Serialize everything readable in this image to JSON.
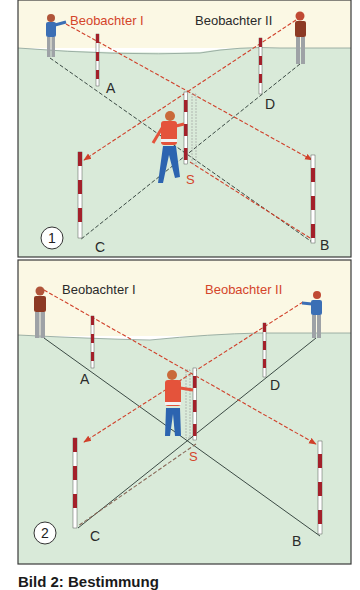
{
  "colors": {
    "sky": "#fbf8e4",
    "ground": "#d9ead9",
    "frame": "#3a3a3a",
    "red_line": "#d0402a",
    "dark_line": "#3b4a44",
    "label_red": "#d4452a",
    "label_dark": "#2a2a2a"
  },
  "panels": [
    {
      "id": 1,
      "number": "1",
      "observer_1_label": "Beobachter I",
      "observer_2_label": "Beobachter II",
      "active_observer": 1,
      "point_labels": {
        "A": "A",
        "B": "B",
        "C": "C",
        "D": "D",
        "S": "S"
      }
    },
    {
      "id": 2,
      "number": "2",
      "observer_1_label": "Beobachter I",
      "observer_2_label": "Beobachter II",
      "active_observer": 2,
      "point_labels": {
        "A": "A",
        "B": "B",
        "C": "C",
        "D": "D",
        "S": "S"
      }
    }
  ],
  "caption": "Bild 2: Bestimmung"
}
